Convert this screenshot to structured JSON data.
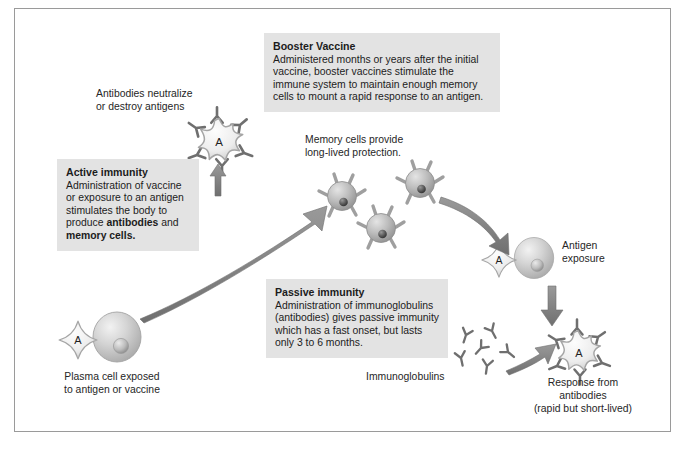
{
  "figure": {
    "frame_color": "#9a9a9a",
    "callout_bg": "#e3e3e3",
    "arrow_color": "#7f7f7f",
    "cell_color": "#c8c8c8",
    "antigen_color": "#ededed"
  },
  "callouts": {
    "booster": {
      "heading": "Booster Vaccine",
      "body": "Administered months or years after the initial vaccine, booster vaccines stimulate the immune system to maintain enough memory cells to mount a rapid response to an antigen."
    },
    "active": {
      "heading": "Active immunity",
      "body_before": "Administration of vaccine or exposure to an antigen stimulates the body to produce ",
      "bold_one": "antibodies",
      "body_middle": " and ",
      "bold_two": "memory cells.",
      "body_full": "Administration of vaccine or exposure to an antigen stimulates the body to produce antibodies and memory cells."
    },
    "passive": {
      "heading": "Passive immunity",
      "body": "Administration of immunoglobulins (antibodies) gives passive immunity which has a fast onset, but lasts only 3 to 6 months."
    }
  },
  "labels": {
    "antibodies_neutralize": "Antibodies neutralize\nor destroy antigens",
    "memory_cells": "Memory cells provide\nlong-lived protection.",
    "plasma_cell": "Plasma cell exposed\nto antigen or vaccine",
    "immunoglobulins": "Immunoglobulins",
    "antigen_exposure": "Antigen\nexposure",
    "response_from_antibodies": "Response from\nantibodies\n(rapid but short-lived)"
  },
  "glyphs": {
    "antigen_letter": "A"
  },
  "structures": {
    "antigen_with_antibodies_top": "antigen-bound-by-antibodies",
    "memory_cell_count": 3,
    "plasma_cell": "plasma-cell",
    "antigen_exposure_pair": "antigen-and-cell",
    "immunoglobulin_count": 6,
    "antigen_with_antibodies_bottom": "antigen-bound-by-antibodies"
  }
}
